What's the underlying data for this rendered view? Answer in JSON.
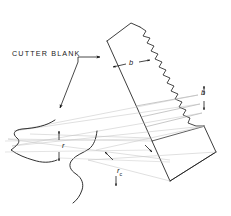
{
  "figure": {
    "type": "technical-line-drawing",
    "background_color": "#ffffff",
    "line_color": "#1a1a1a",
    "faint_line_color": "#b9b9b9"
  },
  "labels": {
    "cutter_blank": "CUTTER BLANK",
    "dim_b_top": "b",
    "dim_b_right": "b",
    "dim_r": "r",
    "dim_rc_base": "r",
    "dim_rc_sub": "c"
  },
  "annotations": [
    {
      "name": "cutter-blank-leader",
      "target": "blank left edge",
      "style": "arrow"
    },
    {
      "name": "profile-leader",
      "target": "tooth profile",
      "style": "arrow"
    },
    {
      "name": "dimension-b-top",
      "value": "b",
      "orientation": "horizontal"
    },
    {
      "name": "dimension-b-right",
      "value": "b",
      "orientation": "vertical"
    },
    {
      "name": "dimension-r",
      "value": "r",
      "orientation": "vertical"
    },
    {
      "name": "dimension-rc",
      "value": "rc",
      "orientation": "vertical"
    }
  ]
}
